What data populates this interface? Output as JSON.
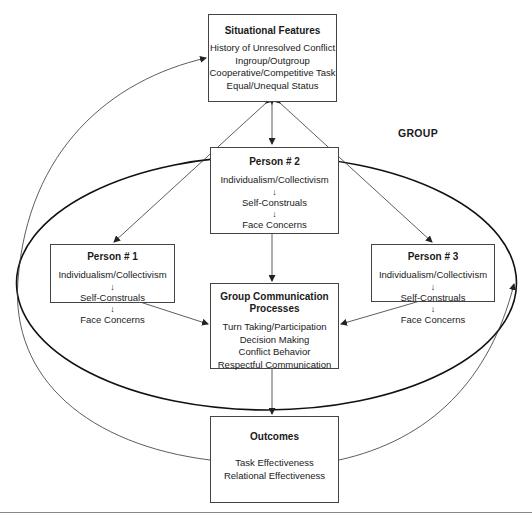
{
  "diagram": {
    "group_label": "GROUP",
    "situational_features": {
      "title": "Situational Features",
      "items": [
        "History of Unresolved Conflict",
        "Ingroup/Outgroup",
        "Cooperative/Competitive Task",
        "Equal/Unequal Status"
      ]
    },
    "persons": [
      {
        "title": "Person # 1",
        "items": [
          "Individualism/Collectivism",
          "Self-Construals",
          "Face Concerns"
        ]
      },
      {
        "title": "Person # 2",
        "items": [
          "Individualism/Collectivism",
          "Self-Construals",
          "Face Concerns"
        ]
      },
      {
        "title": "Person # 3",
        "items": [
          "Individualism/Collectivism",
          "Self-Construals",
          "Face Concerns"
        ]
      }
    ],
    "group_communication": {
      "title_line1": "Group Communication",
      "title_line2": "Processes",
      "items": [
        "Turn Taking/Participation",
        "Decision Making",
        "Conflict Behavior",
        "Respectful Communication"
      ]
    },
    "outcomes": {
      "title": "Outcomes",
      "items": [
        "Task Effectiveness",
        "Relational Effectiveness"
      ]
    },
    "arrow_glyph": "↓",
    "colors": {
      "line": "#333333",
      "box_border": "#444444",
      "background": "#ffffff"
    }
  }
}
